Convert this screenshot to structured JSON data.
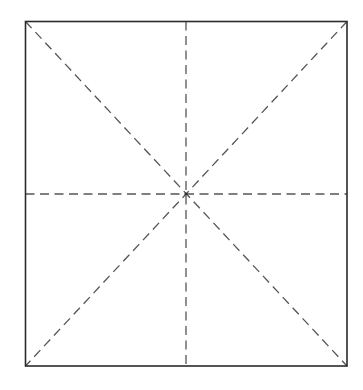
{
  "figure": {
    "title": "Square with dashed symmetry axes",
    "background_color": "#ffffff",
    "canvas": {
      "width": 363,
      "height": 390
    },
    "square": {
      "name": "outer-square",
      "left": 25.5,
      "top": 21.5,
      "right": 347,
      "bottom": 366,
      "width": 321.5,
      "height": 344.5,
      "stroke_color": "#2b2b2b",
      "stroke_width": 1.6,
      "fill": "none"
    },
    "center": {
      "x": 186,
      "y": 194,
      "label": "center-point"
    },
    "dash_style": {
      "stroke_color": "#555555",
      "stroke_width": 1.3,
      "dash_length": 9,
      "gap_length": 5.5,
      "dasharray": "9 5.5"
    },
    "fold_lines": [
      {
        "name": "vertical-axis",
        "kind": "vertical",
        "x1": 186,
        "y1": 21.5,
        "x2": 186,
        "y2": 366
      },
      {
        "name": "horizontal-axis",
        "kind": "horizontal",
        "x1": 25.5,
        "y1": 194,
        "x2": 347,
        "y2": 194
      },
      {
        "name": "diagonal-tl-br",
        "kind": "diagonal",
        "x1": 25.5,
        "y1": 21.5,
        "x2": 347,
        "y2": 366
      },
      {
        "name": "diagonal-tr-bl",
        "kind": "diagonal",
        "x1": 347,
        "y1": 21.5,
        "x2": 25.5,
        "y2": 366
      }
    ],
    "corners": [
      {
        "name": "corner-top-left",
        "x": 25.5,
        "y": 21.5
      },
      {
        "name": "corner-top-right",
        "x": 347,
        "y": 21.5
      },
      {
        "name": "corner-bottom-right",
        "x": 347,
        "y": 366
      },
      {
        "name": "corner-bottom-left",
        "x": 25.5,
        "y": 366
      }
    ],
    "sector_count": 8
  }
}
